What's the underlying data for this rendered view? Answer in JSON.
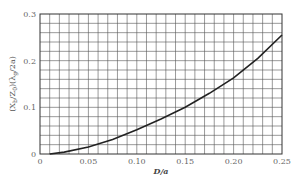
{
  "chart_data": {
    "type": "line",
    "title": "",
    "xlabel": "D/a",
    "ylabel": "(X_b/Z_0)(λ_g/2a)",
    "xlim": [
      0,
      0.25
    ],
    "ylim": [
      0,
      0.3
    ],
    "x_ticks": [
      "0",
      "0.05",
      "0.10",
      "0.15",
      "0.20",
      "0.25"
    ],
    "y_ticks": [
      "0",
      "0.1",
      "0.2",
      "0.3"
    ],
    "grid": true,
    "grid_minor_x": 0.01,
    "grid_minor_y": 0.02,
    "legend": null,
    "series": [
      {
        "name": "reactance",
        "x": [
          0.01,
          0.025,
          0.05,
          0.075,
          0.1,
          0.125,
          0.15,
          0.175,
          0.2,
          0.225,
          0.25
        ],
        "y": [
          0.0,
          0.004,
          0.015,
          0.031,
          0.052,
          0.075,
          0.1,
          0.13,
          0.163,
          0.205,
          0.255
        ]
      }
    ]
  },
  "labels": {
    "x_axis": "D/a",
    "y_axis_main": "(X",
    "y_axis_sub1": "b",
    "y_axis_mid": "/Z",
    "y_axis_sub2": "0",
    "y_axis_mid2": ")(λ",
    "y_axis_sub3": "g",
    "y_axis_end": "/2a)"
  }
}
